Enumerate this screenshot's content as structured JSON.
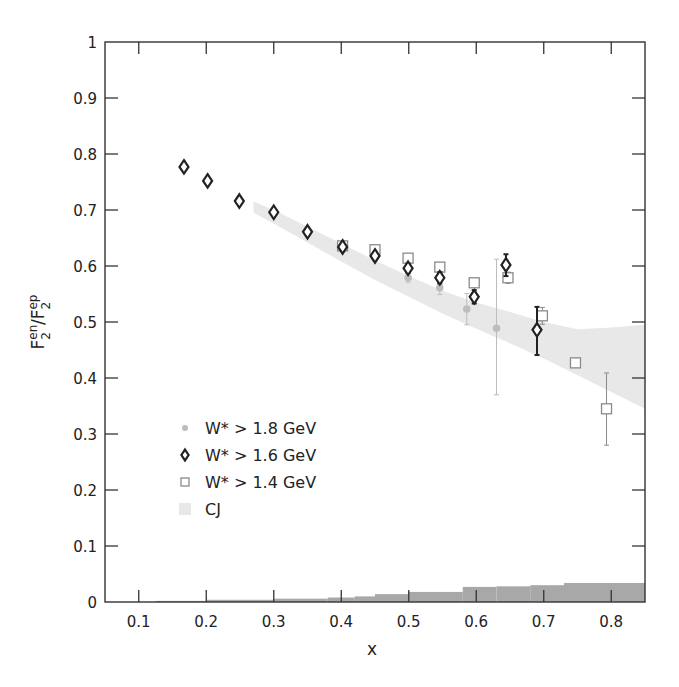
{
  "chart_data": {
    "type": "scatter",
    "title": "",
    "xlabel": "x",
    "ylabel": "F2en/F2ep",
    "ylabel_parts": {
      "base1": "F",
      "sup1": "en",
      "sub1": "2",
      "slash": "/",
      "base2": "F",
      "sup2": "ep",
      "sub2": "2"
    },
    "xlim": [
      0.05,
      0.85
    ],
    "ylim": [
      0,
      1
    ],
    "xticks": [
      0.1,
      0.2,
      0.3,
      0.4,
      0.5,
      0.6,
      0.7,
      0.8
    ],
    "xtick_labels": [
      "0.1",
      "0.2",
      "0.3",
      "0.4",
      "0.5",
      "0.6",
      "0.7",
      "0.8"
    ],
    "yticks": [
      0,
      0.1,
      0.2,
      0.3,
      0.4,
      0.5,
      0.6,
      0.7,
      0.8,
      0.9,
      1
    ],
    "ytick_labels": [
      "0",
      "0.1",
      "0.2",
      "0.3",
      "0.4",
      "0.5",
      "0.6",
      "0.7",
      "0.8",
      "0.9",
      "1"
    ],
    "grid": false,
    "legend_position": "lower-left",
    "series": [
      {
        "name": "W* > 1.8 GeV",
        "marker": "circle",
        "color": "#bdbdbd",
        "x": [
          0.167,
          0.202,
          0.249,
          0.3,
          0.35,
          0.402,
          0.45,
          0.499,
          0.546,
          0.586,
          0.63
        ],
        "y": [
          0.777,
          0.752,
          0.716,
          0.696,
          0.661,
          0.634,
          0.62,
          0.579,
          0.561,
          0.523,
          0.489
        ],
        "yerr_low": [
          0.004,
          0.004,
          0.004,
          0.004,
          0.005,
          0.005,
          0.006,
          0.008,
          0.012,
          0.028,
          0.119
        ],
        "yerr_high": [
          0.004,
          0.004,
          0.004,
          0.004,
          0.005,
          0.005,
          0.006,
          0.008,
          0.012,
          0.028,
          0.123
        ]
      },
      {
        "name": "W* > 1.6 GeV",
        "marker": "diamond",
        "color": "#222222",
        "x": [
          0.167,
          0.202,
          0.249,
          0.3,
          0.35,
          0.402,
          0.45,
          0.499,
          0.546,
          0.597,
          0.644,
          0.69
        ],
        "y": [
          0.777,
          0.752,
          0.716,
          0.696,
          0.661,
          0.634,
          0.618,
          0.596,
          0.579,
          0.545,
          0.602,
          0.486
        ],
        "yerr_low": [
          0.004,
          0.004,
          0.004,
          0.004,
          0.005,
          0.005,
          0.006,
          0.008,
          0.01,
          0.012,
          0.02,
          0.045
        ],
        "yerr_high": [
          0.004,
          0.004,
          0.004,
          0.004,
          0.005,
          0.005,
          0.006,
          0.008,
          0.01,
          0.012,
          0.019,
          0.041
        ]
      },
      {
        "name": "W* > 1.4 GeV",
        "marker": "square",
        "color": "#8a8a8a",
        "x": [
          0.402,
          0.45,
          0.499,
          0.546,
          0.597,
          0.647,
          0.698,
          0.747,
          0.793
        ],
        "y": [
          0.636,
          0.629,
          0.614,
          0.598,
          0.57,
          0.579,
          0.511,
          0.427,
          0.345
        ],
        "yerr_low": [
          0.004,
          0.005,
          0.006,
          0.007,
          0.008,
          0.01,
          0.015,
          0.008,
          0.065
        ],
        "yerr_high": [
          0.004,
          0.005,
          0.006,
          0.007,
          0.008,
          0.01,
          0.015,
          0.008,
          0.064
        ]
      }
    ],
    "band": {
      "name": "CJ",
      "color": "#e8e8e8",
      "x": [
        0.27,
        0.3,
        0.35,
        0.4,
        0.45,
        0.5,
        0.55,
        0.6,
        0.65,
        0.7,
        0.75,
        0.8,
        0.85
      ],
      "upper": [
        0.715,
        0.7,
        0.67,
        0.64,
        0.61,
        0.582,
        0.556,
        0.535,
        0.518,
        0.5,
        0.487,
        0.49,
        0.495
      ],
      "lower": [
        0.695,
        0.676,
        0.642,
        0.608,
        0.575,
        0.545,
        0.515,
        0.488,
        0.462,
        0.435,
        0.405,
        0.375,
        0.345
      ]
    },
    "systematic_band": {
      "color": "#a8a8a8",
      "steps": [
        {
          "x0": 0.125,
          "x1": 0.2,
          "h": 0.002
        },
        {
          "x0": 0.2,
          "x1": 0.3,
          "h": 0.004
        },
        {
          "x0": 0.3,
          "x1": 0.38,
          "h": 0.006
        },
        {
          "x0": 0.38,
          "x1": 0.42,
          "h": 0.008
        },
        {
          "x0": 0.42,
          "x1": 0.45,
          "h": 0.01
        },
        {
          "x0": 0.45,
          "x1": 0.5,
          "h": 0.014
        },
        {
          "x0": 0.5,
          "x1": 0.58,
          "h": 0.018
        },
        {
          "x0": 0.58,
          "x1": 0.63,
          "h": 0.027
        },
        {
          "x0": 0.63,
          "x1": 0.68,
          "h": 0.028
        },
        {
          "x0": 0.68,
          "x1": 0.73,
          "h": 0.03
        },
        {
          "x0": 0.73,
          "x1": 0.85,
          "h": 0.034
        }
      ]
    },
    "legend": [
      {
        "label": "W* > 1.8 GeV",
        "marker": "circle"
      },
      {
        "label": "W* > 1.6 GeV",
        "marker": "diamond"
      },
      {
        "label": "W* > 1.4 GeV",
        "marker": "square"
      },
      {
        "label": "CJ",
        "marker": "band"
      }
    ]
  }
}
